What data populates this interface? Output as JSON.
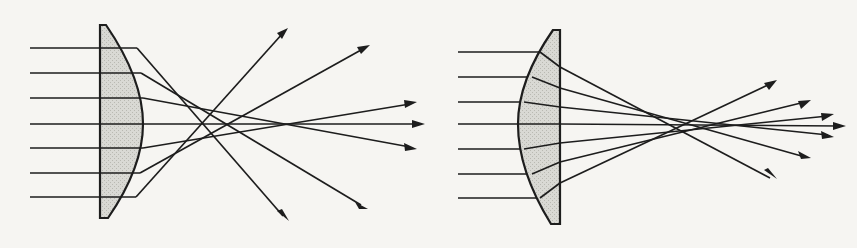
{
  "figure": {
    "background_color": "#f6f5f2",
    "ink_color": "#1d1d1d",
    "glass_fill_color": "#d9d9d4",
    "glass_hatch_color": "#b9b9b2",
    "width": 857,
    "height": 248
  },
  "panels": [
    {
      "id": "left",
      "name": "plano-convex-flat-side-to-source",
      "caption": "",
      "lens": {
        "name": "plano-convex-lens-flat-front",
        "orientation": "flat face toward incoming light, convex face toward focus",
        "flat_face_x": 100,
        "vertex_x": 143,
        "top_y": 25,
        "bottom_y": 218,
        "edge_top_x": 106,
        "edge_bottom_x": 108,
        "sagitta": 37
      },
      "axis_y": 124,
      "incoming_rays": [
        {
          "y": 48,
          "start_x": 30
        },
        {
          "y": 73,
          "start_x": 30
        },
        {
          "y": 98,
          "start_x": 30
        },
        {
          "y": 124,
          "start_x": 30
        },
        {
          "y": 148,
          "start_x": 30
        },
        {
          "y": 173,
          "start_x": 30
        },
        {
          "y": 197,
          "start_x": 30
        }
      ],
      "exit_arrow_tips": [
        {
          "x": 288,
          "y": 28
        },
        {
          "x": 370,
          "y": 45
        },
        {
          "x": 415,
          "y": 103
        },
        {
          "x": 424,
          "y": 124
        },
        {
          "x": 415,
          "y": 148
        },
        {
          "x": 366,
          "y": 208
        },
        {
          "x": 288,
          "y": 220
        }
      ],
      "caustic": {
        "start_x": 196,
        "end_x": 290,
        "spread": "broad"
      }
    },
    {
      "id": "right",
      "name": "plano-convex-curved-side-to-source",
      "caption": "",
      "lens": {
        "name": "plano-convex-lens-convex-front",
        "orientation": "convex face toward incoming light, flat face toward focus",
        "flat_face_x": 560,
        "vertex_x": 518,
        "top_y": 30,
        "bottom_y": 224,
        "edge_top_x": 553,
        "edge_bottom_x": 551,
        "sagitta": 36
      },
      "axis_y": 124,
      "incoming_rays": [
        {
          "y": 52,
          "start_x": 458
        },
        {
          "y": 77,
          "start_x": 458
        },
        {
          "y": 102,
          "start_x": 458
        },
        {
          "y": 124,
          "start_x": 458
        },
        {
          "y": 149,
          "start_x": 458
        },
        {
          "y": 174,
          "start_x": 458
        },
        {
          "y": 198,
          "start_x": 458
        }
      ],
      "exit_arrow_tips": [
        {
          "x": 776,
          "y": 80
        },
        {
          "x": 810,
          "y": 100
        },
        {
          "x": 832,
          "y": 117
        },
        {
          "x": 845,
          "y": 126
        },
        {
          "x": 832,
          "y": 133
        },
        {
          "x": 810,
          "y": 153
        },
        {
          "x": 776,
          "y": 174
        }
      ],
      "caustic": {
        "start_x": 672,
        "end_x": 732,
        "spread": "tight"
      }
    }
  ]
}
